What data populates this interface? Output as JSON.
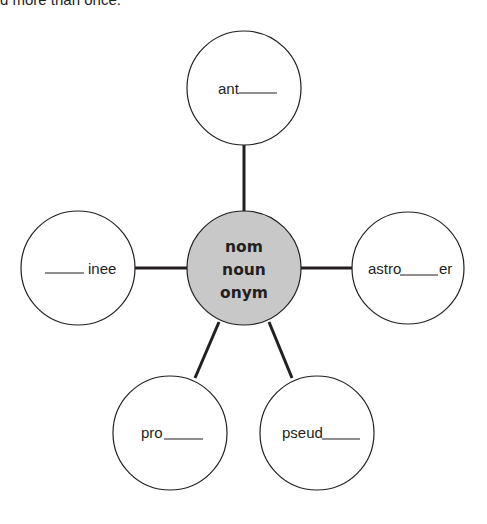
{
  "header": {
    "clipped_instruction": "d more than once."
  },
  "diagram": {
    "type": "word-web",
    "center": {
      "lines": [
        "nom",
        "noun",
        "onym"
      ],
      "fill": "#c8c8c8"
    },
    "nodes": [
      {
        "id": "top",
        "prefix": "ant",
        "suffix": "",
        "blank_position": "after"
      },
      {
        "id": "left",
        "prefix": "",
        "suffix": "inee",
        "blank_position": "before"
      },
      {
        "id": "right",
        "prefix": "astro",
        "suffix": "er",
        "blank_position": "middle"
      },
      {
        "id": "bottom-left",
        "prefix": "pro",
        "suffix": "",
        "blank_position": "after"
      },
      {
        "id": "bottom-right",
        "prefix": "pseud",
        "suffix": "",
        "blank_position": "after"
      }
    ],
    "colors": {
      "stroke": "#231f20",
      "node_fill": "#ffffff",
      "center_fill": "#c8c8c8"
    }
  }
}
